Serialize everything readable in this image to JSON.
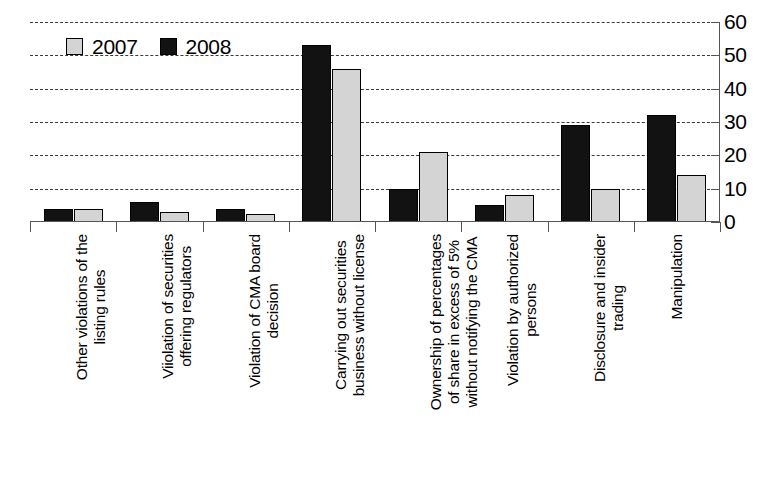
{
  "chart_data": {
    "type": "bar",
    "title": "",
    "subtitle": "",
    "xlabel": "",
    "ylabel": "",
    "ylim": [
      0,
      60
    ],
    "ytick_step": 10,
    "yticks": [
      60,
      50,
      40,
      30,
      20,
      10,
      0
    ],
    "ytick_labels": [
      "60",
      "50",
      "40",
      "30",
      "20",
      "10",
      "0"
    ],
    "y_axis_position": "right",
    "grid": true,
    "grid_style": "dotted-horizontal",
    "legend_position": "top-left-inside",
    "categories": [
      "Other violations of the listing rules",
      "Viiolation of securities offering regulators",
      "Violation of CMA board decision",
      "Carrying out securities business without license",
      "Ownership of percentages of share in excess of 5% without notifying the CMA",
      "Violation by authorized persons",
      "Disclosure and insider trading",
      "Manipulation"
    ],
    "category_label_lines": [
      [
        "Other violations of the",
        "listing rules"
      ],
      [
        "Viiolation of securities",
        "offering regulators"
      ],
      [
        "Violation of CMA board",
        "decision"
      ],
      [
        "Carrying out securities",
        "business without license"
      ],
      [
        "Ownership of percentages",
        "of share in excess of 5%",
        "without notifying the CMA"
      ],
      [
        "Violation by authorized",
        "persons"
      ],
      [
        "Disclosure and insider",
        "trading"
      ],
      [
        "Manipulation"
      ]
    ],
    "series": [
      {
        "name": "2008",
        "color": "#121212",
        "values": [
          4,
          6,
          4,
          53,
          10,
          5,
          29,
          32
        ]
      },
      {
        "name": "2007",
        "color": "#d4d4d4",
        "values": [
          4,
          3,
          2.5,
          46,
          21,
          8,
          10,
          14
        ]
      }
    ]
  },
  "legend": {
    "entries": [
      {
        "label": "2007",
        "swatch": "light-gray-square",
        "color": "#d4d4d4"
      },
      {
        "label": "2008",
        "swatch": "black-square",
        "color": "#121212"
      }
    ]
  },
  "axis": {
    "y_tick_labels": [
      "60",
      "50",
      "40",
      "30",
      "20",
      "10",
      "0"
    ]
  }
}
